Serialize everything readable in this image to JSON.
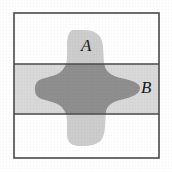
{
  "figure": {
    "type": "venn-diagram-set-intersection",
    "canvas": {
      "width": 172,
      "height": 172,
      "background": "#ffffff"
    },
    "frame": {
      "name": "sample-space-rectangle",
      "x": 14,
      "y": 13,
      "width": 145,
      "height": 145,
      "stroke": "#4a4a4a",
      "stroke_width": 1.6,
      "fill": "#ffffff"
    },
    "band": {
      "name": "event-B-horizontal-band",
      "label": "B",
      "x": 14,
      "y": 64,
      "width": 145,
      "height": 50,
      "fill": "#d9d9d9",
      "stroke": "#4a4a4a",
      "stroke_width": 1.6
    },
    "blob": {
      "name": "event-A-cross-region",
      "label": "A",
      "fill": "#cdcdcd",
      "center_x": 87,
      "center_y": 89,
      "horizontal_extent": [
        35,
        140
      ],
      "vertical_extent": [
        30,
        145
      ]
    },
    "intersection": {
      "name": "A-intersect-B",
      "fill": "#8f8f8f",
      "description": "overlap of cross region A with band B"
    },
    "labels": [
      {
        "id": "A",
        "text": "A",
        "x": 81,
        "y": 37,
        "style": "italic-serif"
      },
      {
        "id": "B",
        "text": "B",
        "x": 141,
        "y": 79,
        "style": "italic-serif"
      }
    ],
    "colors": {
      "frame_stroke": "#4a4a4a",
      "band_fill": "#d9d9d9",
      "blob_fill": "#cdcdcd",
      "intersection_fill": "#8f8f8f",
      "label_color": "#1a1a1a",
      "background": "#ffffff"
    }
  }
}
